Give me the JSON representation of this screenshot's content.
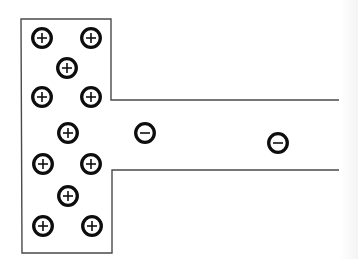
{
  "diagram": {
    "title": "",
    "colors": {
      "background": "#ffffff",
      "outline": "#4a4a4a",
      "charge": "#0d0d0d"
    },
    "outline": {
      "name": "t-shaped-conductor-outline",
      "points": [
        [
          339,
          100
        ],
        [
          111,
          100
        ],
        [
          111,
          19
        ],
        [
          21,
          19
        ],
        [
          22,
          253
        ],
        [
          112,
          253
        ],
        [
          112,
          170
        ],
        [
          339,
          170
        ]
      ]
    },
    "charges": [
      {
        "sign": "+",
        "label": "positive-charge",
        "x": 42,
        "y": 38
      },
      {
        "sign": "+",
        "label": "positive-charge",
        "x": 91,
        "y": 38
      },
      {
        "sign": "+",
        "label": "positive-charge",
        "x": 67,
        "y": 68
      },
      {
        "sign": "+",
        "label": "positive-charge",
        "x": 42,
        "y": 97
      },
      {
        "sign": "+",
        "label": "positive-charge",
        "x": 91,
        "y": 97
      },
      {
        "sign": "+",
        "label": "positive-charge",
        "x": 68,
        "y": 133
      },
      {
        "sign": "+",
        "label": "positive-charge",
        "x": 43,
        "y": 164
      },
      {
        "sign": "+",
        "label": "positive-charge",
        "x": 91,
        "y": 164
      },
      {
        "sign": "+",
        "label": "positive-charge",
        "x": 68,
        "y": 196
      },
      {
        "sign": "+",
        "label": "positive-charge",
        "x": 43,
        "y": 226
      },
      {
        "sign": "+",
        "label": "positive-charge",
        "x": 92,
        "y": 226
      },
      {
        "sign": "−",
        "label": "negative-charge",
        "x": 145,
        "y": 133
      },
      {
        "sign": "−",
        "label": "negative-charge",
        "x": 278,
        "y": 143
      }
    ],
    "counts": {
      "positive": 11,
      "negative": 2
    }
  }
}
